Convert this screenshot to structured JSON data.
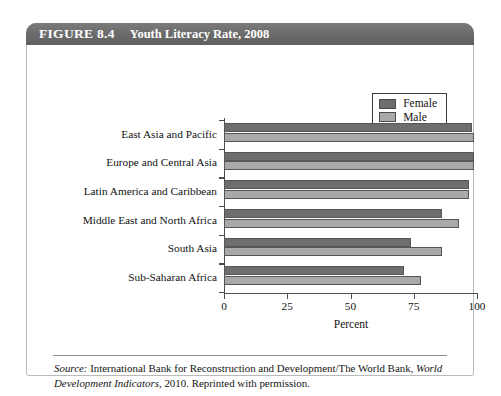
{
  "figure": {
    "number": "FIGURE 8.4",
    "title": "Youth Literacy Rate, 2008",
    "source_prefix": "Source:",
    "source_text_1": " International Bank for Reconstruction and Development/The World Bank, ",
    "source_italic": "World Development Indicators",
    "source_text_2": ", 2010. Reprinted with permission."
  },
  "colors": {
    "female": "#6e6e6e",
    "male": "#a9a9a9",
    "header_bar": "#6b6b6b",
    "axis": "#4d4d4d"
  },
  "chart_data": {
    "type": "bar",
    "orientation": "horizontal",
    "title": "Youth Literacy Rate, 2008",
    "xlabel": "Percent",
    "ylabel": "",
    "xlim": [
      0,
      100
    ],
    "xticks": [
      0,
      25,
      50,
      75,
      100
    ],
    "xtick_labels": [
      "0",
      "25",
      "50",
      "75",
      "100"
    ],
    "grid": false,
    "legend_position": "top-right",
    "categories": [
      "East Asia and Pacific",
      "Europe and Central Asia",
      "Latin America and Caribbean",
      "Middle East and North Africa",
      "South Asia",
      "Sub-Saharan Africa"
    ],
    "series": [
      {
        "name": "Female",
        "color": "#6e6e6e",
        "values": [
          98,
          99,
          97,
          86,
          74,
          71
        ]
      },
      {
        "name": "Male",
        "color": "#a9a9a9",
        "values": [
          99,
          99,
          97,
          93,
          86,
          78
        ]
      }
    ]
  }
}
